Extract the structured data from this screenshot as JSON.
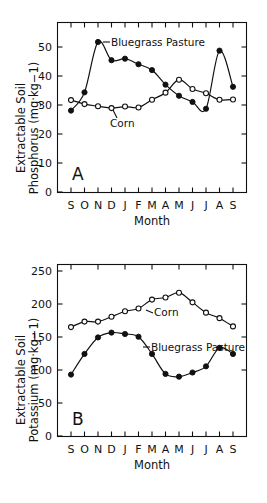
{
  "figure": {
    "name": "soil-nutrient-seasonal-figure",
    "panel_count": 2
  },
  "chart_data": [
    {
      "type": "line",
      "panel": "A",
      "title": "",
      "xlabel": "Month",
      "ylabel": "Extractable Soil Phosphorus (mg·kg−1)",
      "ylabel_line1": "Extractable Soil",
      "ylabel_line2": "Phosphorus (mg·kg−1)",
      "x": [
        "S",
        "O",
        "N",
        "D",
        "J",
        "F",
        "M",
        "A",
        "M",
        "J",
        "J",
        "A",
        "S"
      ],
      "categories": [
        "S",
        "O",
        "N",
        "D",
        "J",
        "F",
        "M",
        "A",
        "M",
        "J",
        "J",
        "A",
        "S"
      ],
      "xlim": [
        0,
        14
      ],
      "ylim": [
        0,
        55
      ],
      "yticks": [
        0,
        10,
        20,
        30,
        40,
        50
      ],
      "ytick_labels": [
        "0",
        "10",
        "20",
        "30",
        "40",
        "50"
      ],
      "grid": false,
      "legend_position": "inline-annotations",
      "series": [
        {
          "name": "Bluegrass Pasture",
          "marker": "filled-circle",
          "label_text": "Bluegrass Pasture",
          "values": [
            26.5,
            32.4,
            48.7,
            42.8,
            43.3,
            41.5,
            39.6,
            34.9,
            31.3,
            29.3,
            27.1,
            45.9,
            34.2
          ]
        },
        {
          "name": "Corn",
          "marker": "open-circle",
          "label_text": "Corn",
          "values": [
            29.9,
            28.6,
            27.9,
            27.3,
            27.8,
            27.5,
            30.0,
            32.3,
            36.5,
            33.5,
            32.1,
            30.0,
            30.1
          ]
        }
      ]
    },
    {
      "type": "line",
      "panel": "B",
      "title": "",
      "xlabel": "Month",
      "ylabel": "Extractable Soil Potassium (mg·kg−1)",
      "ylabel_line1": "Extractable Soil",
      "ylabel_line2": "Potassium (mg·kg−1)",
      "x": [
        "S",
        "O",
        "N",
        "D",
        "J",
        "F",
        "M",
        "A",
        "M",
        "J",
        "J",
        "A",
        "S"
      ],
      "categories": [
        "S",
        "O",
        "N",
        "D",
        "J",
        "F",
        "M",
        "A",
        "M",
        "J",
        "J",
        "A",
        "S"
      ],
      "xlim": [
        0,
        14
      ],
      "ylim": [
        0,
        250
      ],
      "yticks": [
        0,
        50,
        100,
        150,
        200,
        250
      ],
      "ytick_labels": [
        "0",
        "50",
        "100",
        "150",
        "200",
        "250"
      ],
      "grid": false,
      "legend_position": "inline-annotations",
      "series": [
        {
          "name": "Corn",
          "marker": "open-circle",
          "label_text": "Corn",
          "values": [
            159,
            167,
            167,
            174,
            182,
            186,
            199,
            202,
            209,
            195,
            180,
            172,
            160
          ]
        },
        {
          "name": "Bluegrass Pasture",
          "marker": "filled-circle",
          "label_text": "Bluegrass Pasture",
          "values": [
            90,
            120,
            144,
            151,
            149,
            145,
            120,
            91,
            87,
            93,
            102,
            129,
            120
          ]
        }
      ]
    }
  ],
  "panel_a": {
    "letter": "A",
    "xlabel": "Month",
    "ylabel_line1": "Extractable Soil",
    "ylabel_line2": "Phosphorus (mg·kg−1)",
    "ytick_labels": [
      "50",
      "40",
      "30",
      "20",
      "10",
      "0"
    ],
    "xtick_labels": [
      "S",
      "O",
      "N",
      "D",
      "J",
      "F",
      "M",
      "A",
      "M",
      "J",
      "J",
      "A",
      "S"
    ],
    "annotation_bluegrass": "Bluegrass Pasture",
    "annotation_corn": "Corn"
  },
  "panel_b": {
    "letter": "B",
    "xlabel": "Month",
    "ylabel_line1": "Extractable Soil",
    "ylabel_line2": "Potassium (mg·kg−1)",
    "ytick_labels": [
      "250",
      "200",
      "150",
      "100",
      "50",
      "0"
    ],
    "xtick_labels": [
      "S",
      "O",
      "N",
      "D",
      "J",
      "F",
      "M",
      "A",
      "M",
      "J",
      "J",
      "A",
      "S"
    ],
    "annotation_bluegrass": "Bluegrass Pasture",
    "annotation_corn": "Corn"
  },
  "colors": {
    "ink": "#111111",
    "background": "#ffffff",
    "marker_open_fill": "#ffffff"
  }
}
